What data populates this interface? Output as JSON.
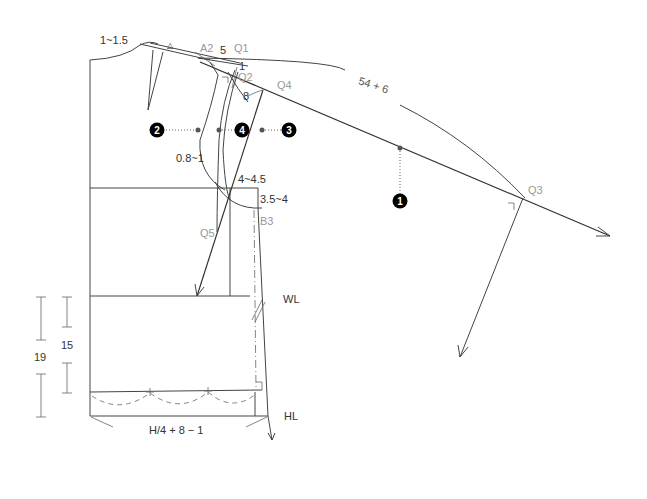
{
  "diagram": {
    "labels": {
      "neck_drop": "1~1.5",
      "triangle": "△",
      "A2": "A2",
      "five": "5",
      "Q1": "Q1",
      "one": "1",
      "Q2": "Q2",
      "eight": "8",
      "Q4": "Q4",
      "cap_length": "54 + 6",
      "Q3": "Q3",
      "depth": "0.8~1",
      "width_4": "4~4.5",
      "width_35": "3.5~4",
      "B3": "B3",
      "Q5": "Q5",
      "WL": "WL",
      "HL": "HL",
      "dim_15": "15",
      "dim_19": "19",
      "hip_formula": "H/4 + 8 − 1"
    },
    "markers": [
      {
        "num": "1"
      },
      {
        "num": "2"
      },
      {
        "num": "3"
      },
      {
        "num": "4"
      }
    ]
  }
}
